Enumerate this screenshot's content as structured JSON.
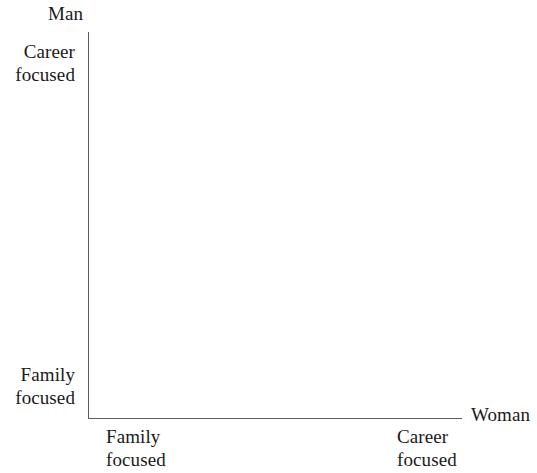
{
  "chart_data": {
    "type": "scatter",
    "title": "",
    "subtitle": "",
    "xlabel": "Woman",
    "ylabel": "Man",
    "grid": false,
    "legend": null,
    "annotations": [],
    "series": [],
    "x": [],
    "values": [],
    "xlim": [
      "Family focused",
      "Career focused"
    ],
    "ylim": [
      "Family focused",
      "Career focused"
    ],
    "x_tick_labels": [
      "Family focused",
      "Career focused"
    ],
    "y_tick_labels": [
      "Family focused",
      "Career focused"
    ],
    "note": "Empty two-axis framework; no data points plotted."
  },
  "axes": {
    "y": {
      "name": "Man",
      "high_label": {
        "line1": "Career",
        "line2": "focused"
      },
      "low_label": {
        "line1": "Family",
        "line2": "focused"
      }
    },
    "x": {
      "name": "Woman",
      "low_label": {
        "line1": "Family",
        "line2": "focused"
      },
      "high_label": {
        "line1": "Career",
        "line2": "focused"
      }
    }
  },
  "colors": {
    "background": "#ffffff",
    "axis_line": "#5d5d5d",
    "text": "#1a1a1a"
  }
}
